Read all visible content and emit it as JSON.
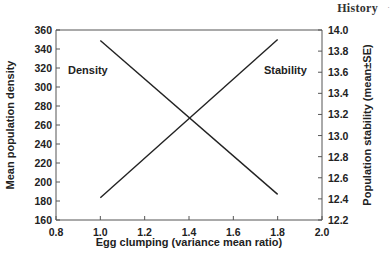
{
  "page_header": {
    "text": "History",
    "marker": "·"
  },
  "chart_data": {
    "type": "line",
    "title": "",
    "xlabel": "Egg clumping (variance mean ratio)",
    "ylabel": "Mean population density",
    "y2label": "Population stability (mean±SE)",
    "xlim": [
      0.8,
      2.0
    ],
    "ylim": [
      160,
      360
    ],
    "y2lim": [
      12.2,
      14.0
    ],
    "x_ticks": [
      "0.8",
      "1.0",
      "1.2",
      "1.4",
      "1.6",
      "1.8",
      "2.0"
    ],
    "y_ticks": [
      "160",
      "180",
      "200",
      "220",
      "240",
      "260",
      "280",
      "300",
      "320",
      "340",
      "360"
    ],
    "y2_ticks": [
      "12.2",
      "12.4",
      "12.6",
      "12.8",
      "13.0",
      "13.2",
      "13.4",
      "13.6",
      "13.8",
      "14.0"
    ],
    "grid": false,
    "series": [
      {
        "name": "Density",
        "axis": "left",
        "x": [
          1.0,
          1.8
        ],
        "y": [
          349,
          187
        ],
        "color": "#222222"
      },
      {
        "name": "Stability",
        "axis": "right",
        "x": [
          1.0,
          1.8
        ],
        "y": [
          12.41,
          13.91
        ],
        "color": "#222222"
      }
    ],
    "annotations": [
      {
        "text": "Density",
        "series": "Density"
      },
      {
        "text": "Stability",
        "series": "Stability"
      }
    ]
  }
}
